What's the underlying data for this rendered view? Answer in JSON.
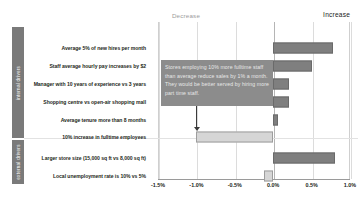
{
  "header": {
    "decrease_label": "Decrease",
    "increase_label": "Increase"
  },
  "categories": {
    "internal": "internal drivers",
    "external": "external drivers"
  },
  "callout": {
    "text": "Stores employing 10% more fulltime staff than average reduce sales by 1% a month. They would be better served by hiring more part time staff."
  },
  "chart_data": {
    "type": "bar",
    "orientation": "horizontal",
    "title": "",
    "subtitle": "",
    "xlabel": "",
    "ylabel": "",
    "xlim": [
      -0.015,
      0.01
    ],
    "grid": true,
    "legend_position": "none",
    "tick_labels": [
      "-1.5%",
      "-1.0%",
      "-0.5%",
      "0.0%",
      "0.5%",
      "1.0%"
    ],
    "tick_values": [
      -0.015,
      -0.01,
      -0.005,
      0.0,
      0.005,
      0.01
    ],
    "annotations": [
      "Decrease",
      "Increase"
    ],
    "colors": {
      "positive": "#7f7f7f",
      "negative": "#d6d6d6",
      "band": "#7a7a7a",
      "callout": "#8c8c8c"
    },
    "categories": [
      "Average 5% of new hires per month",
      "Staff average hourly pay increases by $2",
      "Manager with 10 years of experience vs 3 years",
      "Shopping centre vs open-air shopping mall",
      "Average tenure more than 8 months",
      "10% increase in fulltime employees",
      "Larger store size (15,000 sq ft vs 8,000 sq ft)",
      "Local unemployment rate is 10% vs 5%"
    ],
    "values": [
      0.0078,
      0.005,
      0.0021,
      0.002,
      0.0006,
      -0.01,
      0.008,
      -0.0012
    ],
    "value_labels": [
      "0.78%",
      "0.50%",
      "0.21%",
      "0.20%",
      "0.06%",
      "-1.00%",
      "0.80%",
      "-0.12%"
    ],
    "groups": [
      "internal drivers",
      "internal drivers",
      "internal drivers",
      "internal drivers",
      "internal drivers",
      "internal drivers",
      "external drivers",
      "external drivers"
    ]
  }
}
